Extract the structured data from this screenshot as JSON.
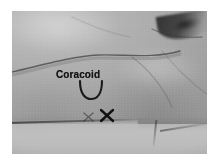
{
  "figure": {
    "domain": "natural-image",
    "kind": "clinical-photograph",
    "modality": "grayscale photograph",
    "background_color": "#ffffff",
    "frame": {
      "left": 12,
      "top": 11,
      "width": 195,
      "height": 143
    }
  },
  "photo": {
    "tones": {
      "skin_light": "#c2c2c2",
      "skin_mid": "#a9a9a9",
      "skin_dark": "#979797",
      "shadow": "#6e6e6e",
      "axilla_dark": "#282828",
      "drape_light": "#c0c0c0",
      "marker_ink": "#141414"
    }
  },
  "annotations": {
    "label": {
      "text": "Coracoid",
      "x": 44,
      "y": 58,
      "color": "#141414",
      "style": "handwritten surgical marker, bold"
    },
    "arc": {
      "name": "coracoid-outline-arc",
      "shape": "u-shaped arc",
      "center_x": 78,
      "center_y": 76,
      "radius": 11
    },
    "marks": [
      {
        "name": "x-mark-faint",
        "glyph": "X",
        "x": 76,
        "y": 106,
        "size": 9,
        "stroke_width": 1.1,
        "opacity": 0.55,
        "note": "smaller, lighter marker stroke"
      },
      {
        "name": "x-mark-bold",
        "glyph": "X",
        "x": 95,
        "y": 105,
        "size": 12,
        "stroke_width": 2.3,
        "opacity": 1,
        "note": "larger, heavily inked marker stroke"
      }
    ],
    "contours": [
      {
        "name": "clavicle-deltopectoral-contour",
        "path": "M -4 62 C 30 54, 62 45, 86 44 C 112 43, 140 48, 168 40",
        "stroke": "rgba(45,45,45,0.62)",
        "stroke_width": 1.4
      },
      {
        "name": "deltoid-crease",
        "path": "M 120 46 C 136 58, 150 74, 160 96",
        "stroke": "rgba(80,80,80,0.30)",
        "stroke_width": 1.2
      },
      {
        "name": "pectoral-fold",
        "path": "M 150 40 C 162 54, 176 70, 196 84",
        "stroke": "rgba(85,85,85,0.26)",
        "stroke_width": 1.1
      },
      {
        "name": "axillary-fold-edge",
        "path": "M 140 18 C 152 24, 166 28, 190 26",
        "stroke": "rgba(40,40,40,0.45)",
        "stroke_width": 1.3
      }
    ]
  }
}
